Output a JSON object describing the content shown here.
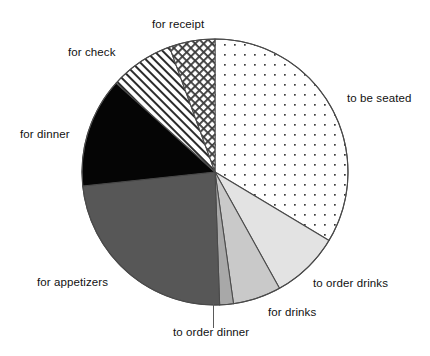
{
  "chart_data": {
    "type": "pie",
    "title": "",
    "subtitle": "",
    "xlabel": "",
    "ylabel": "",
    "legend_position": "callout-labels",
    "grid": false,
    "start_angle_deg_from_12oclock": 0,
    "direction": "clockwise",
    "categories": [
      "to be seated",
      "to order drinks",
      "for drinks",
      "to order dinner",
      "for appetizers",
      "for dinner",
      "for check",
      "for receipt"
    ],
    "values": [
      33.6,
      8.3,
      5.8,
      1.7,
      24.0,
      13.4,
      7.7,
      5.5
    ],
    "units": "percent",
    "slices": [
      {
        "label": "to be seated",
        "value": 33.6,
        "start_deg": 0,
        "end_deg": 121,
        "fill": "dots",
        "color": "#ffffff",
        "pattern_color": "#3a3a3a"
      },
      {
        "label": "to order drinks",
        "value": 8.3,
        "start_deg": 121,
        "end_deg": 151,
        "fill": "solid",
        "color": "#e3e3e3",
        "pattern_color": "#e3e3e3"
      },
      {
        "label": "for drinks",
        "value": 5.8,
        "start_deg": 151,
        "end_deg": 172,
        "fill": "solid",
        "color": "#c9c9c9",
        "pattern_color": "#c9c9c9"
      },
      {
        "label": "to order dinner",
        "value": 1.7,
        "start_deg": 172,
        "end_deg": 178,
        "fill": "solid",
        "color": "#a8a8a8",
        "pattern_color": "#a8a8a8"
      },
      {
        "label": "for appetizers",
        "value": 24.0,
        "start_deg": 178,
        "end_deg": 264,
        "fill": "solid",
        "color": "#575757",
        "pattern_color": "#575757"
      },
      {
        "label": "for dinner",
        "value": 13.4,
        "start_deg": 264,
        "end_deg": 312,
        "fill": "solid",
        "color": "#050505",
        "pattern_color": "#050505"
      },
      {
        "label": "for check",
        "value": 7.7,
        "start_deg": 312,
        "end_deg": 340,
        "fill": "diagonal-hatch",
        "color": "#ffffff",
        "pattern_color": "#2d2d2d"
      },
      {
        "label": "for receipt",
        "value": 5.5,
        "start_deg": 340,
        "end_deg": 360,
        "fill": "crosshatch",
        "color": "#ffffff",
        "pattern_color": "#3a3a3a"
      }
    ],
    "geometry": {
      "center_x": 215,
      "center_y": 172,
      "radius": 133,
      "outline_color": "#4a4a4a"
    }
  },
  "labels": {
    "to_be_seated": "to be seated",
    "to_order_drinks": "to order drinks",
    "for_drinks": "for drinks",
    "to_order_dinner": "to order dinner",
    "for_appetizers": "for appetizers",
    "for_dinner": "for dinner",
    "for_check": "for check",
    "for_receipt": "for receipt"
  }
}
